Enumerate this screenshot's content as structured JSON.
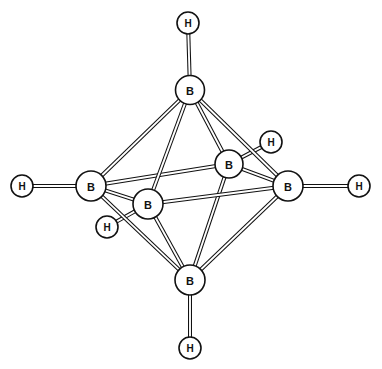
{
  "figure": {
    "background_color": "#ffffff",
    "bond_stroke_color": "#111111",
    "bond_fill_color": "#ffffff",
    "atom_fill_color": "#ffffff",
    "atom_stroke_color": "#111111",
    "label_color": "#111111",
    "width": 382,
    "height": 369
  },
  "atoms": {
    "boron_top": {
      "id": "B-top",
      "element": "B",
      "label": "B",
      "x": 190,
      "y": 90,
      "r": 14.5
    },
    "boron_left": {
      "id": "B-left",
      "element": "B",
      "label": "B",
      "x": 91,
      "y": 186,
      "r": 15.0
    },
    "boron_right": {
      "id": "B-right",
      "element": "B",
      "label": "B",
      "x": 288,
      "y": 186,
      "r": 15.0
    },
    "boron_bottom": {
      "id": "B-bottom",
      "element": "B",
      "label": "B",
      "x": 190,
      "y": 280,
      "r": 15.0
    },
    "boron_back": {
      "id": "B-back",
      "element": "B",
      "label": "B",
      "x": 229,
      "y": 164,
      "r": 14.0
    },
    "boron_front": {
      "id": "B-front",
      "element": "B",
      "label": "B",
      "x": 148,
      "y": 204,
      "r": 15.0
    },
    "hydrogen_top": {
      "id": "H-top",
      "element": "H",
      "label": "H",
      "x": 188,
      "y": 23,
      "r": 11.0
    },
    "hydrogen_left": {
      "id": "H-left",
      "element": "H",
      "label": "H",
      "x": 22,
      "y": 186,
      "r": 11.0
    },
    "hydrogen_right": {
      "id": "H-right",
      "element": "H",
      "label": "H",
      "x": 359,
      "y": 186,
      "r": 11.0
    },
    "hydrogen_bottom": {
      "id": "H-bottom",
      "element": "H",
      "label": "H",
      "x": 190,
      "y": 348,
      "r": 11.0
    },
    "hydrogen_back": {
      "id": "H-back",
      "element": "H",
      "label": "H",
      "x": 271,
      "y": 142,
      "r": 11.0
    },
    "hydrogen_front": {
      "id": "H-front",
      "element": "H",
      "label": "H",
      "x": 107,
      "y": 227,
      "r": 11.0
    }
  },
  "bonds": {
    "bb_width": 4.0,
    "bh_width": 4.0,
    "boron_boron": [
      {
        "from": "boron_top",
        "to": "boron_left"
      },
      {
        "from": "boron_top",
        "to": "boron_right"
      },
      {
        "from": "boron_top",
        "to": "boron_back"
      },
      {
        "from": "boron_top",
        "to": "boron_front"
      },
      {
        "from": "boron_bottom",
        "to": "boron_left"
      },
      {
        "from": "boron_bottom",
        "to": "boron_right"
      },
      {
        "from": "boron_bottom",
        "to": "boron_back"
      },
      {
        "from": "boron_bottom",
        "to": "boron_front"
      },
      {
        "from": "boron_left",
        "to": "boron_back"
      },
      {
        "from": "boron_back",
        "to": "boron_right"
      },
      {
        "from": "boron_right",
        "to": "boron_front"
      },
      {
        "from": "boron_front",
        "to": "boron_left"
      }
    ],
    "boron_hydrogen": [
      {
        "from": "boron_top",
        "to": "hydrogen_top"
      },
      {
        "from": "boron_left",
        "to": "hydrogen_left"
      },
      {
        "from": "boron_right",
        "to": "hydrogen_right"
      },
      {
        "from": "boron_bottom",
        "to": "hydrogen_bottom"
      },
      {
        "from": "boron_back",
        "to": "hydrogen_back"
      },
      {
        "from": "boron_front",
        "to": "hydrogen_front"
      }
    ]
  },
  "draw_order": {
    "bonds_behind": [
      [
        "boron_top",
        "boron_left"
      ],
      [
        "boron_top",
        "boron_right"
      ],
      [
        "boron_top",
        "boron_back"
      ],
      [
        "boron_bottom",
        "boron_left"
      ],
      [
        "boron_bottom",
        "boron_right"
      ],
      [
        "boron_bottom",
        "boron_back"
      ],
      [
        "boron_left",
        "boron_back"
      ],
      [
        "boron_back",
        "boron_right"
      ],
      [
        "boron_top",
        "boron_front"
      ],
      [
        "boron_bottom",
        "boron_front"
      ],
      [
        "boron_right",
        "boron_front"
      ],
      [
        "boron_front",
        "boron_left"
      ]
    ],
    "atom_order": [
      "hydrogen_top",
      "hydrogen_left",
      "hydrogen_right",
      "hydrogen_bottom",
      "hydrogen_back",
      "hydrogen_front",
      "boron_top",
      "boron_left",
      "boron_right",
      "boron_bottom",
      "boron_back",
      "boron_front"
    ],
    "bh_order": [
      [
        "boron_top",
        "hydrogen_top"
      ],
      [
        "boron_left",
        "hydrogen_left"
      ],
      [
        "boron_right",
        "hydrogen_right"
      ],
      [
        "boron_bottom",
        "hydrogen_bottom"
      ],
      [
        "boron_back",
        "hydrogen_back"
      ],
      [
        "boron_front",
        "hydrogen_front"
      ]
    ]
  }
}
